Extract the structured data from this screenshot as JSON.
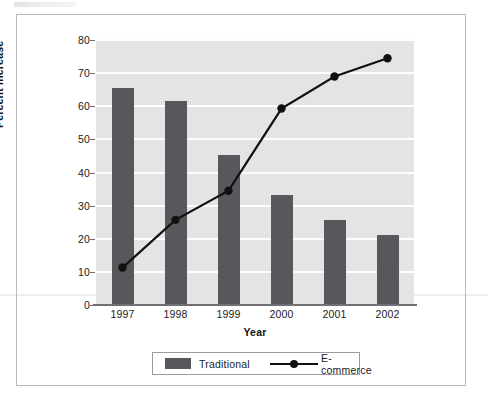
{
  "chart_data": {
    "type": "bar",
    "title": "",
    "xlabel": "Year",
    "ylabel": "Percent Increase",
    "categories": [
      "1997",
      "1998",
      "1999",
      "2000",
      "2001",
      "2002"
    ],
    "series": [
      {
        "name": "Traditional",
        "type": "bar",
        "color": "#58585c",
        "values": [
          65.4,
          61.7,
          45.3,
          33.3,
          25.8,
          21.2
        ]
      },
      {
        "name": "E-commerce",
        "type": "line",
        "color": "#111111",
        "values": [
          11.3,
          25.7,
          34.5,
          59.3,
          69.0,
          74.5
        ]
      }
    ],
    "ylim": [
      0,
      80
    ],
    "yticks": [
      0,
      10,
      20,
      30,
      40,
      50,
      60,
      70,
      80
    ],
    "ytick_labels": [
      "0",
      "10",
      "20",
      "30",
      "40",
      "50",
      "60",
      "70",
      "80"
    ],
    "grid": "horizontal-white",
    "legend_position": "bottom-center",
    "plot_background": "#e4e4e4"
  },
  "legend": {
    "traditional_label": "Traditional",
    "ecommerce_label": "E-commerce"
  },
  "colors": {
    "bar": "#58585c",
    "line": "#111111",
    "plot_bg": "#e4e4e4",
    "gridline": "#fdfdfd",
    "frame": "#b9b9bf"
  }
}
